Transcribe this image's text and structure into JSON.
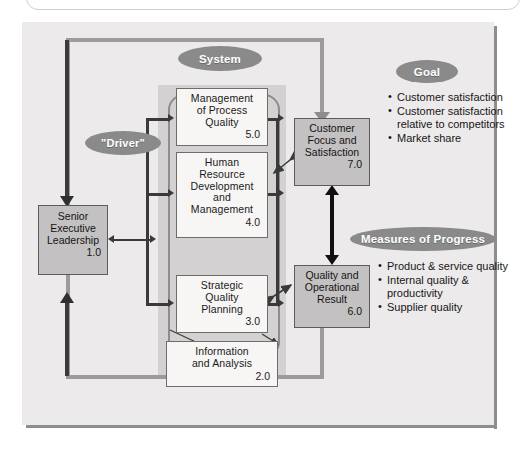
{
  "figure": {
    "title_hidden": "",
    "colors": {
      "plate_bg": "#eceaea",
      "panel_bg": "#d3d1d1",
      "result_box": "#c3c1c1",
      "criteria_box": "#f7f6f5",
      "pill": "#8a8a8a",
      "loop_line": "#9b9b9b",
      "driver_line": "#3b3b3b",
      "double_arrow": "#111111"
    }
  },
  "labels": {
    "system": "System",
    "driver": "\"Driver\"",
    "goal": "Goal",
    "measures": "Measures of Progress"
  },
  "boxes": {
    "senior_executive_leadership": {
      "lines": [
        "Senior",
        "Executive",
        "Leadership"
      ],
      "number": "1.0"
    },
    "management_of_process_quality": {
      "lines": [
        "Management",
        "of Process",
        "Quality"
      ],
      "number": "5.0"
    },
    "human_resource_development_and_management": {
      "lines": [
        "Human",
        "Resource",
        "Development",
        "and",
        "Management"
      ],
      "number": "4.0"
    },
    "strategic_quality_planning": {
      "lines": [
        "Strategic",
        "Quality",
        "Planning"
      ],
      "number": "3.0"
    },
    "information_and_analysis": {
      "lines": [
        "Information",
        "and Analysis"
      ],
      "number": "2.0"
    },
    "customer_focus_and_satisfaction": {
      "lines": [
        "Customer",
        "Focus and",
        "Satisfaction"
      ],
      "number": "7.0"
    },
    "quality_and_operational_result": {
      "lines": [
        "Quality and",
        "Operational",
        "Result"
      ],
      "number": "6.0"
    }
  },
  "goal_bullets": [
    "Customer satisfaction",
    "Customer satisfaction relative to competitors",
    "Market share"
  ],
  "measures_bullets": [
    "Product & service quality",
    "Internal quality & productivity",
    "Supplier quality"
  ]
}
